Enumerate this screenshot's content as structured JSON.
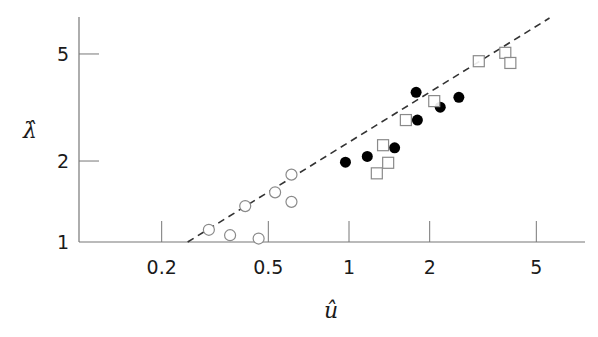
{
  "chart_data": {
    "type": "scatter",
    "title": "",
    "xlabel": "û",
    "ylabel": "λ̂",
    "xscale": "log",
    "yscale": "log",
    "xlim": [
      0.1,
      8
    ],
    "ylim": [
      1,
      7
    ],
    "xticks": [
      0.2,
      0.5,
      1,
      2,
      5
    ],
    "xtick_labels": [
      "0.2",
      "0.5",
      "1",
      "2",
      "5"
    ],
    "yticks": [
      1,
      2,
      5
    ],
    "ytick_labels": [
      "1",
      "2",
      "5"
    ],
    "grid": false,
    "legend": null,
    "series": [
      {
        "name": "open circles",
        "marker": "circle-open",
        "points": [
          {
            "x": 0.3,
            "y": 1.11
          },
          {
            "x": 0.36,
            "y": 1.06
          },
          {
            "x": 0.46,
            "y": 1.03
          },
          {
            "x": 0.41,
            "y": 1.36
          },
          {
            "x": 0.53,
            "y": 1.53
          },
          {
            "x": 0.61,
            "y": 1.78
          },
          {
            "x": 0.61,
            "y": 1.41
          }
        ]
      },
      {
        "name": "filled circles",
        "marker": "circle-filled",
        "points": [
          {
            "x": 0.97,
            "y": 1.98
          },
          {
            "x": 1.17,
            "y": 2.08
          },
          {
            "x": 1.48,
            "y": 2.24
          },
          {
            "x": 1.8,
            "y": 2.84
          },
          {
            "x": 1.78,
            "y": 3.6
          },
          {
            "x": 2.19,
            "y": 3.17
          },
          {
            "x": 2.57,
            "y": 3.45
          }
        ]
      },
      {
        "name": "open squares",
        "marker": "square-open",
        "points": [
          {
            "x": 1.27,
            "y": 1.8
          },
          {
            "x": 1.4,
            "y": 1.97
          },
          {
            "x": 1.34,
            "y": 2.29
          },
          {
            "x": 1.63,
            "y": 2.84
          },
          {
            "x": 2.08,
            "y": 3.34
          },
          {
            "x": 3.05,
            "y": 4.7
          },
          {
            "x": 3.83,
            "y": 5.05
          },
          {
            "x": 4.0,
            "y": 4.63
          }
        ]
      }
    ],
    "reference_line": {
      "style": "dashed",
      "from": {
        "x": 0.25,
        "y": 1.0
      },
      "to": {
        "x": 5.6,
        "y": 6.8
      }
    }
  },
  "axes": {
    "x_title": "û",
    "y_title": "λ̂"
  }
}
